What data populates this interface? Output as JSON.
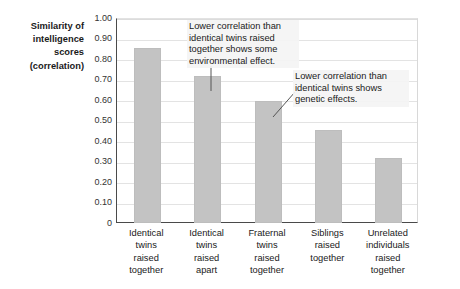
{
  "chart_data": {
    "type": "bar",
    "title": "",
    "xlabel": "",
    "ylabel": "Similarity of\nintelligence\nscores\n(correlation)",
    "ylim": [
      0,
      1.0
    ],
    "ytick_labels": [
      "1.00",
      "0.90",
      "0.80",
      "0.70",
      "0.60",
      "0.50",
      "0.40",
      "0.30",
      "0.20",
      "0.10",
      "0"
    ],
    "ytick_values": [
      1.0,
      0.9,
      0.8,
      0.7,
      0.6,
      0.5,
      0.4,
      0.3,
      0.2,
      0.1,
      0
    ],
    "grid": "horizontal",
    "legend": "none",
    "categories": [
      "Identical\ntwins\nraised\ntogether",
      "Identical\ntwins\nraised\napart",
      "Fraternal\ntwins\nraised\ntogether",
      "Siblings\nraised\ntogether",
      "Unrelated\nindividuals\nraised\ntogether"
    ],
    "values": [
      0.86,
      0.72,
      0.6,
      0.46,
      0.32
    ],
    "bar_color": "#c3c3c3",
    "annotations": [
      {
        "text": "Lower correlation than identical twins raised together shows some environmental effect.",
        "points_to_category": "Identical twins raised apart",
        "leader": "vertical"
      },
      {
        "text": "Lower correlation than identical twins shows genetic effects.",
        "points_to_category": "Fraternal twins raised together",
        "leader": "diagonal"
      }
    ]
  },
  "axis": {
    "y_title": "Similarity of\nintelligence\nscores\n(correlation)"
  }
}
